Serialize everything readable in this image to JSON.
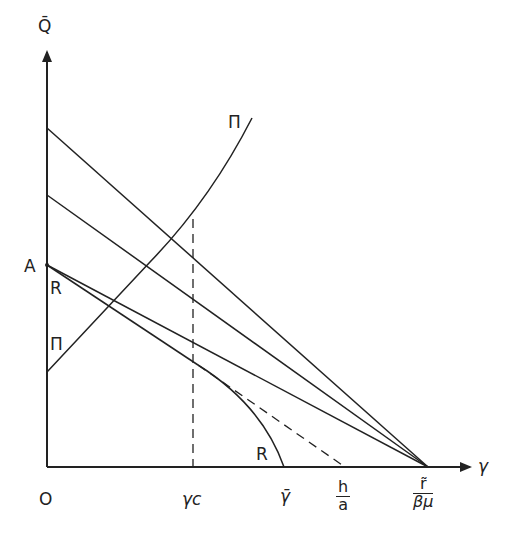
{
  "diagram": {
    "axes": {
      "y_label": "Q̄",
      "x_label": "γ",
      "origin_label": "O"
    },
    "point_labels": {
      "A": "A",
      "R_top": "R",
      "R_bottom": "R",
      "Pi_top": "Π",
      "Pi_bottom": "Π"
    },
    "x_ticks": {
      "gamma_c": "γc",
      "gamma_bar": "γ̄",
      "h_over_a_num": "h",
      "h_over_a_den": "a",
      "r_tilde_num": "r̃",
      "r_tilde_den": "βμ"
    },
    "colors": {
      "ink": "#222222",
      "background": "#ffffff"
    }
  }
}
